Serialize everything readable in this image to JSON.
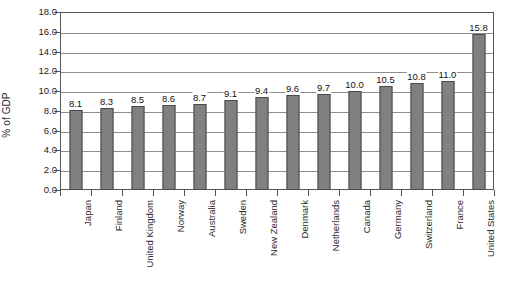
{
  "chart_data": {
    "type": "bar",
    "title": "",
    "subtitle": "",
    "xlabel": "",
    "ylabel": "% of GDP",
    "ylim": [
      0.0,
      18.0
    ],
    "ytick_step": 2.0,
    "ytick_labels": [
      "0.0",
      "2.0",
      "4.0",
      "6.0",
      "8.0",
      "10.0",
      "12.0",
      "14.0",
      "16.0",
      "18.0"
    ],
    "grid": "horizontal",
    "legend": "none",
    "bar_color": "#808080",
    "bar_edge_color": "#4a4a4a",
    "categories": [
      "Japan",
      "Finland",
      "United Kingdom",
      "Norway",
      "Australia",
      "Sweden",
      "New Zealand",
      "Denmark",
      "Netherlands",
      "Canada",
      "Germany",
      "Switzerland",
      "France",
      "United States"
    ],
    "values": [
      8.1,
      8.3,
      8.5,
      8.6,
      8.7,
      9.1,
      9.4,
      9.6,
      9.7,
      10.0,
      10.5,
      10.8,
      11.0,
      15.8
    ],
    "value_labels": [
      "8.1",
      "8.3",
      "8.5",
      "8.6",
      "8.7",
      "9.1",
      "9.4",
      "9.6",
      "9.7",
      "10.0",
      "10.5",
      "10.8",
      "11.0",
      "15.8"
    ]
  }
}
